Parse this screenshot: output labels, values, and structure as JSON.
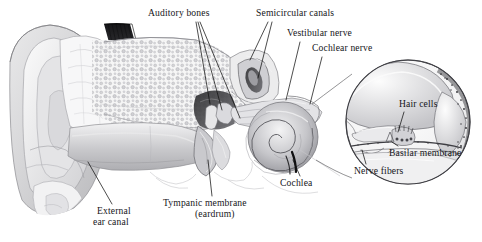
{
  "figure": {
    "style": "grayscale pencil medical illustration",
    "background_color": "#ffffff",
    "ink_color": "#16161a",
    "leader_line_color": "#111111"
  },
  "labels": [
    {
      "id": "auditory-bones",
      "text": "Auditory bones",
      "x": 148,
      "y": 8,
      "align": "left"
    },
    {
      "id": "semicircular",
      "text": "Semicircular canals",
      "x": 256,
      "y": 8,
      "align": "left"
    },
    {
      "id": "vestibular-nerve",
      "text": "Vestibular nerve",
      "x": 287,
      "y": 28,
      "align": "left"
    },
    {
      "id": "cochlear-nerve",
      "text": "Cochlear nerve",
      "x": 312,
      "y": 43,
      "align": "left"
    },
    {
      "id": "hair-cells",
      "text": "Hair cells",
      "x": 399,
      "y": 99,
      "align": "left"
    },
    {
      "id": "basilar-membrane",
      "text": "Basilar membrane",
      "x": 389,
      "y": 148,
      "align": "left"
    },
    {
      "id": "nerve-fibers",
      "text": "Nerve fibers",
      "x": 354,
      "y": 166,
      "align": "left"
    },
    {
      "id": "cochlea",
      "text": "Cochlea",
      "x": 280,
      "y": 178,
      "align": "left"
    },
    {
      "id": "tympanic-line1",
      "text": "Tympanic membrane",
      "x": 163,
      "y": 198,
      "align": "left"
    },
    {
      "id": "tympanic-line2",
      "text": "(eardrum)",
      "x": 195,
      "y": 209,
      "align": "left"
    },
    {
      "id": "external-line1",
      "text": "External",
      "x": 97,
      "y": 206,
      "align": "left"
    },
    {
      "id": "external-line2",
      "text": "ear canal",
      "x": 93,
      "y": 217,
      "align": "left"
    }
  ],
  "structures": [
    "pinna (auricle)",
    "external ear canal",
    "mastoid bone with air cells",
    "tympanic membrane",
    "malleus, incus, stapes",
    "semicircular canals",
    "vestibular nerve",
    "cochlear nerve",
    "cochlea",
    "organ of Corti inset",
    "hair cells",
    "basilar membrane",
    "nerve fibers"
  ]
}
